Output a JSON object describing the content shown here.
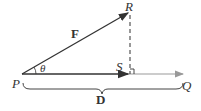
{
  "diagram": {
    "labels": {
      "P": "P",
      "Q": "Q",
      "R": "R",
      "S": "S",
      "F": "F",
      "theta": "θ",
      "D": "D"
    },
    "colors": {
      "line": "#333333",
      "gray_arrow": "#888888"
    }
  }
}
